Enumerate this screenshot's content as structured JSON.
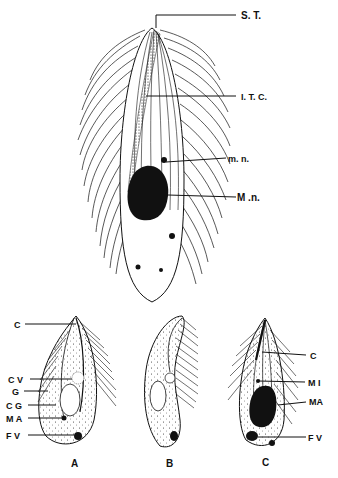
{
  "figure": {
    "main": {
      "labels": {
        "st": "S. T.",
        "itc": "I. T. C.",
        "mn_small": "m. n.",
        "mn_large": "M .n."
      }
    },
    "panel_a": {
      "caption": "A",
      "labels": {
        "c": "C",
        "cv": "C V",
        "g": "G",
        "cg": "C G",
        "ma": "M A",
        "fv": "F V"
      }
    },
    "panel_b": {
      "caption": "B"
    },
    "panel_c": {
      "caption": "C",
      "labels": {
        "c": "C",
        "mi": "M I",
        "ma": "MA",
        "fv": "F V"
      }
    },
    "colors": {
      "ink": "#111111",
      "background": "#ffffff"
    }
  }
}
